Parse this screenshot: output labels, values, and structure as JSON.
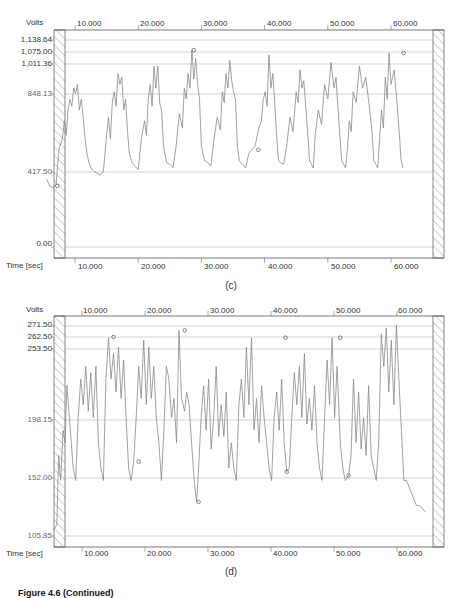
{
  "figure_caption": "Figure 4.6 (Continued)",
  "chart_data": [
    {
      "type": "line",
      "panel": "(c)",
      "title": "",
      "ylabel": "Volts",
      "xlabel": "Time [sec]",
      "ylim": [
        -50,
        1170
      ],
      "xlim": [
        5,
        65
      ],
      "grid": true,
      "y_ticks": [
        "1,138.64",
        "1,075.00",
        "1,011.36",
        "848.13",
        "417.50",
        "0.00"
      ],
      "y_tick_values": [
        1138.64,
        1075.0,
        1011.36,
        848.13,
        417.5,
        0.0
      ],
      "x_ticks": [
        "10.000",
        "20.000",
        "30.000",
        "40.000",
        "50.000",
        "60.000"
      ],
      "x_tick_values": [
        10,
        20,
        30,
        40,
        50,
        60
      ],
      "markers": [
        {
          "x": 7.2,
          "y": 340,
          "label": "min"
        },
        {
          "x": 28.8,
          "y": 1085,
          "label": "max"
        },
        {
          "x": 39.0,
          "y": 540,
          "label": "min"
        },
        {
          "x": 62.0,
          "y": 1070,
          "label": "max"
        }
      ],
      "description": "Periodic voltage bursts (~9 cycles), each rising from ~400 V baseline to multi-peak tops of ~850–1090 V, period ~6 s",
      "series": [
        {
          "name": "Volts",
          "x": [
            5.5,
            6,
            6.5,
            7,
            7.5,
            8,
            8.3,
            8.6,
            8.9,
            9.2,
            9.5,
            9.8,
            10.1,
            10.4,
            10.7,
            11,
            11.3,
            11.6,
            11.9,
            12.2,
            12.5,
            13,
            13.5,
            14,
            14.5,
            15,
            15.3,
            15.6,
            15.9,
            16.2,
            16.5,
            16.8,
            17.1,
            17.4,
            17.7,
            18,
            18.3,
            18.6,
            19,
            19.5,
            20,
            20.5,
            21,
            21.3,
            21.6,
            21.9,
            22.2,
            22.5,
            22.8,
            23.1,
            23.4,
            23.7,
            24,
            24.5,
            25,
            25.5,
            26,
            26.5,
            27,
            27.3,
            27.6,
            27.9,
            28.2,
            28.5,
            28.8,
            29.1,
            29.4,
            29.7,
            30,
            30.5,
            31,
            31.5,
            32,
            32.5,
            33,
            33.3,
            33.6,
            33.9,
            34.2,
            34.5,
            34.8,
            35.1,
            35.4,
            35.7,
            36,
            36.5,
            37,
            37.5,
            38,
            38.5,
            39,
            39.5,
            39.8,
            40.1,
            40.4,
            40.7,
            41,
            41.3,
            41.6,
            41.9,
            42.2,
            42.5,
            43,
            43.5,
            44,
            44.5,
            45,
            45.3,
            45.6,
            45.9,
            46.2,
            46.5,
            46.8,
            47.1,
            47.4,
            47.7,
            48,
            48.5,
            49,
            49.5,
            50,
            50.5,
            51,
            51.3,
            51.6,
            51.9,
            52.2,
            52.5,
            52.8,
            53.1,
            53.4,
            53.7,
            54,
            54.5,
            55,
            55.5,
            56,
            56.5,
            57,
            57.3,
            57.6,
            57.9,
            58.2,
            58.5,
            58.8,
            59.1,
            59.4,
            59.7,
            60,
            60.5,
            61,
            61.3,
            61.6,
            61.9,
            62.2,
            62.5,
            62.8,
            63.1,
            63.4,
            63.7,
            64,
            64.5
          ],
          "y": [
            380,
            340,
            330,
            345,
            550,
            600,
            700,
            620,
            760,
            820,
            780,
            880,
            850,
            900,
            760,
            820,
            720,
            600,
            520,
            470,
            440,
            420,
            410,
            400,
            420,
            620,
            720,
            600,
            800,
            860,
            780,
            960,
            900,
            940,
            760,
            820,
            640,
            520,
            470,
            450,
            430,
            600,
            700,
            620,
            820,
            900,
            780,
            1000,
            880,
            1000,
            800,
            760,
            560,
            470,
            460,
            440,
            560,
            740,
            660,
            880,
            820,
            960,
            880,
            1085,
            930,
            1040,
            900,
            820,
            560,
            480,
            470,
            450,
            600,
            720,
            650,
            860,
            800,
            960,
            880,
            1030,
            920,
            860,
            820,
            560,
            480,
            460,
            440,
            520,
            540,
            560,
            650,
            700,
            820,
            860,
            780,
            1060,
            880,
            960,
            800,
            620,
            480,
            470,
            460,
            560,
            720,
            640,
            860,
            800,
            980,
            880,
            920,
            780,
            640,
            480,
            460,
            440,
            620,
            760,
            680,
            900,
            820,
            1020,
            880,
            940,
            780,
            620,
            480,
            460,
            440,
            540,
            700,
            640,
            860,
            800,
            1000,
            880,
            940,
            800,
            640,
            480,
            460,
            440,
            600,
            760,
            660,
            940,
            820,
            1070,
            900,
            980,
            780,
            640,
            480,
            440
          ]
        }
      ]
    },
    {
      "type": "line",
      "panel": "(d)",
      "title": "",
      "ylabel": "Volts",
      "xlabel": "Time [sec]",
      "ylim": [
        103,
        276
      ],
      "xlim": [
        5,
        65
      ],
      "grid": true,
      "y_ticks": [
        "271.50",
        "262.50",
        "253.50",
        "198.15",
        "152.00",
        "105.85"
      ],
      "y_tick_values": [
        271.5,
        262.5,
        253.5,
        198.15,
        152.0,
        105.85
      ],
      "x_ticks": [
        "10.000",
        "20.000",
        "30.000",
        "40.000",
        "50.000",
        "60.000"
      ],
      "x_tick_values": [
        10,
        20,
        30,
        40,
        50,
        60
      ],
      "markers": [
        {
          "x": 15.0,
          "y": 262.5,
          "label": "max"
        },
        {
          "x": 19.0,
          "y": 165,
          "label": "min"
        },
        {
          "x": 26.3,
          "y": 268,
          "label": "max"
        },
        {
          "x": 28.5,
          "y": 133,
          "label": "min"
        },
        {
          "x": 42.3,
          "y": 262,
          "label": "max"
        },
        {
          "x": 42.5,
          "y": 157,
          "label": "min"
        },
        {
          "x": 51.0,
          "y": 262,
          "label": "max"
        },
        {
          "x": 52.3,
          "y": 154,
          "label": "min"
        }
      ],
      "description": "Irregular oscillating voltage between ~110 V and ~270 V with dense multi-peak bursts",
      "series": [
        {
          "name": "Volts",
          "x": [
            5.5,
            6,
            6.3,
            6.6,
            7,
            7.3,
            7.6,
            8,
            8.3,
            8.6,
            9,
            9.4,
            9.8,
            10.2,
            10.6,
            11,
            11.4,
            11.8,
            12.2,
            12.6,
            13,
            13.4,
            13.8,
            14.2,
            14.6,
            15,
            15.4,
            15.8,
            16.2,
            16.6,
            17,
            17.4,
            17.8,
            18.2,
            18.6,
            19,
            19.4,
            19.8,
            20.2,
            20.6,
            21,
            21.4,
            21.8,
            22.2,
            22.6,
            23,
            23.4,
            23.8,
            24.2,
            24.6,
            25,
            25.4,
            25.8,
            26.3,
            26.6,
            27,
            27.4,
            27.8,
            28.2,
            28.5,
            28.9,
            29.3,
            29.7,
            30.1,
            30.5,
            30.9,
            31.3,
            31.7,
            32.1,
            32.5,
            32.9,
            33.3,
            33.7,
            34.1,
            34.5,
            34.9,
            35.3,
            35.7,
            36.1,
            36.5,
            36.9,
            37.3,
            37.7,
            38.1,
            38.5,
            38.9,
            39.3,
            39.7,
            40.1,
            40.5,
            40.9,
            41.3,
            41.7,
            42.1,
            42.5,
            42.9,
            43.3,
            43.7,
            44.1,
            44.5,
            44.9,
            45.3,
            45.7,
            46.1,
            46.5,
            46.9,
            47.3,
            47.7,
            48.1,
            48.5,
            48.9,
            49.3,
            49.7,
            50.1,
            50.5,
            51,
            51.4,
            51.8,
            52.3,
            52.7,
            53.1,
            53.5,
            53.9,
            54.3,
            54.7,
            55.1,
            55.5,
            55.9,
            56.3,
            56.7,
            57.1,
            57.5,
            57.9,
            58.3,
            58.7,
            59.1,
            59.5,
            59.9,
            60.3,
            60.7,
            61.1,
            61.5,
            61.9,
            62.3,
            62.7,
            63.1,
            63.5,
            64,
            64.5
          ],
          "y": [
            110,
            115,
            170,
            150,
            190,
            180,
            225,
            200,
            180,
            160,
            150,
            200,
            230,
            210,
            240,
            205,
            235,
            200,
            240,
            180,
            160,
            150,
            230,
            262,
            230,
            250,
            220,
            255,
            215,
            245,
            200,
            160,
            150,
            165,
            200,
            240,
            215,
            260,
            210,
            255,
            215,
            240,
            200,
            180,
            150,
            190,
            240,
            230,
            200,
            215,
            180,
            268,
            215,
            205,
            220,
            210,
            180,
            150,
            133,
            160,
            200,
            225,
            190,
            230,
            175,
            200,
            240,
            185,
            210,
            185,
            220,
            160,
            180,
            160,
            150,
            210,
            230,
            200,
            255,
            210,
            262,
            190,
            215,
            180,
            225,
            200,
            180,
            160,
            150,
            200,
            220,
            190,
            230,
            180,
            157,
            160,
            200,
            235,
            210,
            240,
            200,
            250,
            195,
            215,
            190,
            225,
            180,
            160,
            150,
            200,
            245,
            210,
            262,
            200,
            240,
            180,
            160,
            150,
            154,
            170,
            230,
            180,
            220,
            175,
            200,
            170,
            225,
            170,
            160,
            150,
            180,
            265,
            240,
            270,
            220,
            260,
            210,
            272,
            230,
            190,
            150,
            150,
            145,
            140,
            135,
            130,
            130,
            128,
            125
          ]
        }
      ]
    }
  ],
  "panels": [
    {
      "id": "c",
      "caption": "(c)",
      "y_unit": "Volts",
      "x_unit": "Time [sec]",
      "y_labels": [
        "1,138.64",
        "1,075.00",
        "1,011.36",
        "848.13",
        "417.50",
        "0.00"
      ],
      "x_labels": [
        "10.000",
        "20.000",
        "30.000",
        "40.000",
        "50.000",
        "60.000"
      ]
    },
    {
      "id": "d",
      "caption": "(d)",
      "y_unit": "Volts",
      "x_unit": "Time [sec]",
      "y_labels": [
        "271.50",
        "262.50",
        "253.50",
        "198.15",
        "152.00",
        "105.85"
      ],
      "x_labels": [
        "10.000",
        "20.000",
        "30.000",
        "40.000",
        "50.000",
        "60.000"
      ]
    }
  ],
  "colors": {
    "trace": "#8a8a8a",
    "grid": "#b8b8b8",
    "frame": "#555555",
    "hatch": "#777777"
  }
}
